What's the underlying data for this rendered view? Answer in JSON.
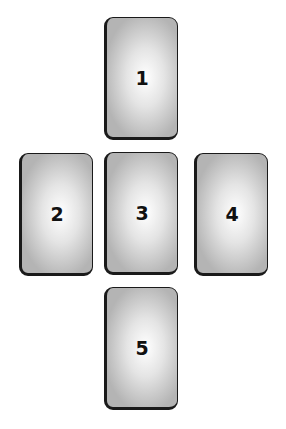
{
  "diagram": {
    "type": "card-spread-layout",
    "cards": [
      {
        "label": "1",
        "x": 104,
        "y": 17
      },
      {
        "label": "2",
        "x": 19,
        "y": 153
      },
      {
        "label": "3",
        "x": 104,
        "y": 152
      },
      {
        "label": "4",
        "x": 194,
        "y": 153
      },
      {
        "label": "5",
        "x": 104,
        "y": 287
      }
    ]
  }
}
